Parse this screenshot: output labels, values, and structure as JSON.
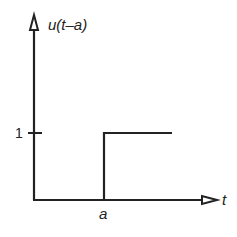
{
  "diagram": {
    "y_axis_label": "u(t–a)",
    "x_axis_label": "t",
    "y_tick_label": "1",
    "x_tick_label": "a",
    "colors": {
      "line": "#222222",
      "background": "#ffffff"
    }
  }
}
